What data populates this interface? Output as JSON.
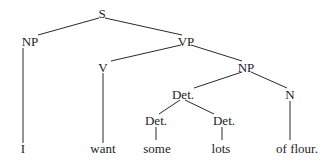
{
  "diagram": {
    "type": "syntax-tree",
    "nodes": {
      "s": {
        "label": "S"
      },
      "np_subject": {
        "label": "NP"
      },
      "vp": {
        "label": "VP"
      },
      "v": {
        "label": "V"
      },
      "np_object": {
        "label": "NP"
      },
      "det_phrase": {
        "label": "Det."
      },
      "n": {
        "label": "N"
      },
      "det_left": {
        "label": "Det."
      },
      "det_right": {
        "label": "Det."
      }
    },
    "leaves": {
      "i": {
        "label": "I"
      },
      "want": {
        "label": "want"
      },
      "some": {
        "label": "some"
      },
      "lots": {
        "label": "lots"
      },
      "of_flour": {
        "label": "of flour."
      }
    },
    "edges": [
      [
        "S",
        "NP"
      ],
      [
        "S",
        "VP"
      ],
      [
        "NP",
        "I"
      ],
      [
        "VP",
        "V"
      ],
      [
        "VP",
        "NP"
      ],
      [
        "V",
        "want"
      ],
      [
        "NP",
        "Det."
      ],
      [
        "NP",
        "N"
      ],
      [
        "Det.",
        "Det."
      ],
      [
        "Det.",
        "Det."
      ],
      [
        "Det.",
        "some"
      ],
      [
        "Det.",
        "lots"
      ],
      [
        "N",
        "of flour."
      ]
    ]
  }
}
